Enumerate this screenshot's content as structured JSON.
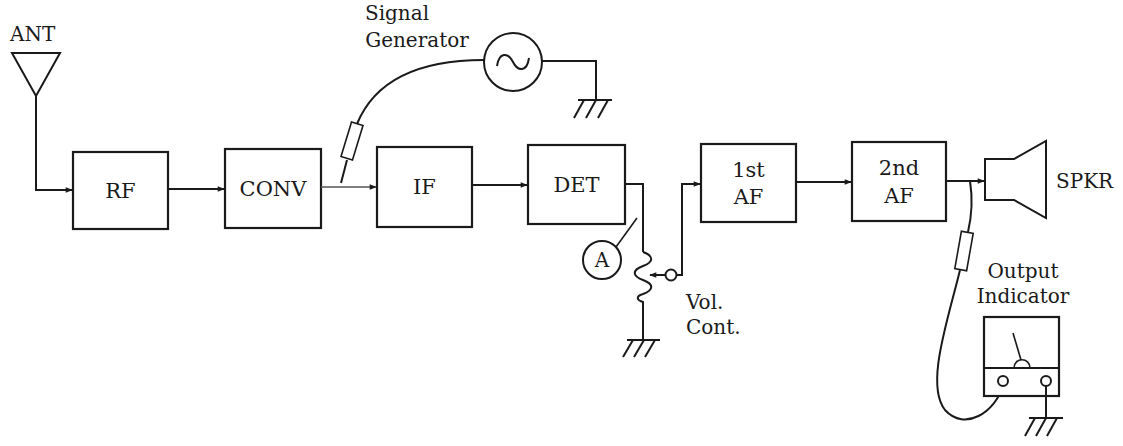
{
  "diagram": {
    "type": "block-diagram",
    "line_color": "#1a1a1a",
    "background": "#ffffff"
  },
  "labels": {
    "antenna": "ANT",
    "signal_generator_line1": "Signal",
    "signal_generator_line2": "Generator",
    "meter_a": "A",
    "vol_line1": "Vol.",
    "vol_line2": "Cont.",
    "speaker": "SPKR",
    "output_line1": "Output",
    "output_line2": "Indicator"
  },
  "blocks": [
    {
      "id": "rf",
      "line1": "RF",
      "line2": ""
    },
    {
      "id": "conv",
      "line1": "CONV",
      "line2": ""
    },
    {
      "id": "if",
      "line1": "IF",
      "line2": ""
    },
    {
      "id": "det",
      "line1": "DET",
      "line2": ""
    },
    {
      "id": "af1",
      "line1": "1st",
      "line2": "AF"
    },
    {
      "id": "af2",
      "line1": "2nd",
      "line2": "AF"
    }
  ],
  "connections": [
    {
      "from": "ANT",
      "to": "RF"
    },
    {
      "from": "RF",
      "to": "CONV"
    },
    {
      "from": "CONV",
      "to": "IF"
    },
    {
      "from": "IF",
      "to": "DET"
    },
    {
      "from": "DET",
      "to": "Vol. Cont."
    },
    {
      "from": "Vol. Cont.",
      "to": "1st AF"
    },
    {
      "from": "1st AF",
      "to": "2nd AF"
    },
    {
      "from": "2nd AF",
      "to": "SPKR"
    },
    {
      "from": "Signal Generator",
      "to": "CONV/IF junction (probe)"
    },
    {
      "from": "2nd AF output",
      "to": "Output Indicator (probe)"
    }
  ]
}
